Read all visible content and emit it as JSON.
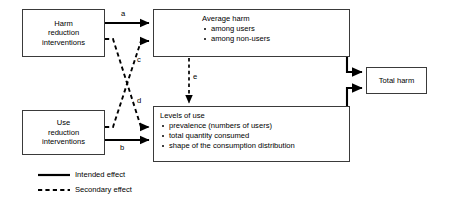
{
  "diagram": {
    "colors": {
      "line": "#000000",
      "box_border": "#3a3a3a",
      "background": "#ffffff",
      "text": "#000000"
    },
    "nodes": {
      "harm_reduction": {
        "name": "harm-reduction-interventions",
        "lines": [
          "Harm",
          "reduction",
          "interventions"
        ]
      },
      "use_reduction": {
        "name": "use-reduction-interventions",
        "lines": [
          "Use",
          "reduction",
          "interventions"
        ]
      },
      "average_harm": {
        "name": "average-harm",
        "title": "Average harm",
        "bullets": [
          "among users",
          "among non-users"
        ]
      },
      "levels_of_use": {
        "name": "levels-of-use",
        "title": "Levels of use",
        "bullets": [
          "prevalence (numbers of users)",
          "total quantity consumed",
          "shape of the consumption distribution"
        ]
      },
      "total_harm": {
        "name": "total-harm",
        "title": "Total harm"
      }
    },
    "edges": [
      {
        "id": "a",
        "label": "a",
        "style": "solid",
        "from": "harm_reduction",
        "to": "average_harm"
      },
      {
        "id": "b",
        "label": "b",
        "style": "solid",
        "from": "use_reduction",
        "to": "levels_of_use"
      },
      {
        "id": "c",
        "label": "c",
        "style": "dashed",
        "from": "use_reduction",
        "to": "average_harm"
      },
      {
        "id": "d",
        "label": "d",
        "style": "dashed",
        "from": "harm_reduction",
        "to": "levels_of_use"
      },
      {
        "id": "e",
        "label": "e",
        "style": "dashed",
        "from": "average_harm",
        "to": "levels_of_use"
      },
      {
        "id": "f",
        "label": "",
        "style": "solid",
        "from": "average_harm",
        "to": "total_harm"
      },
      {
        "id": "g",
        "label": "",
        "style": "solid",
        "from": "levels_of_use",
        "to": "total_harm"
      }
    ],
    "legend": {
      "name": "legend",
      "items": [
        {
          "label": "Intended effect",
          "style": "solid"
        },
        {
          "label": "Secondary effect",
          "style": "dashed"
        }
      ]
    }
  }
}
